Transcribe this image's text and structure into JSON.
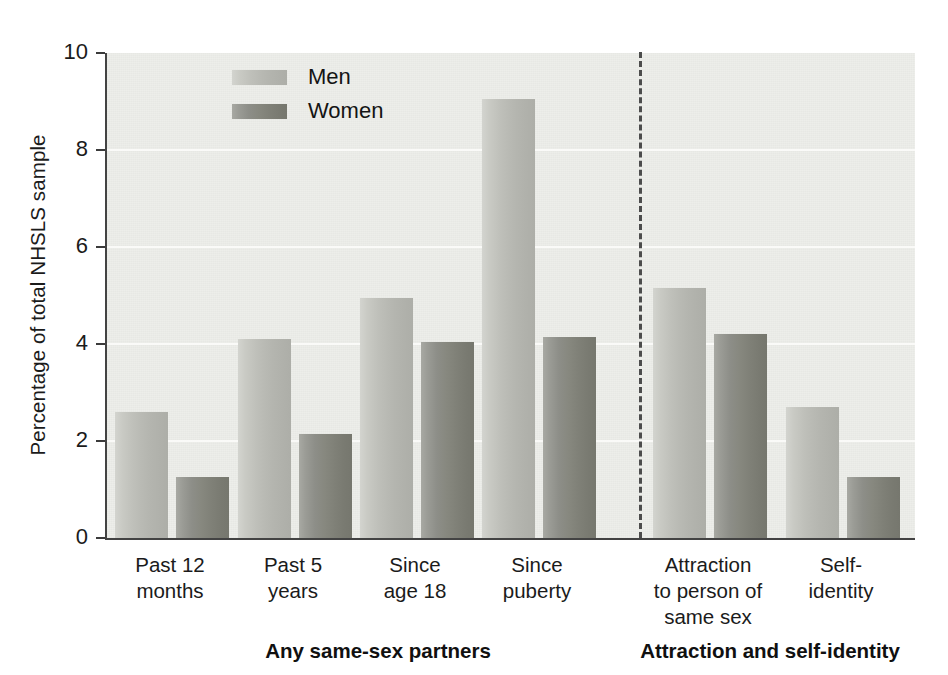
{
  "chart_data": {
    "type": "bar",
    "title": "",
    "xlabel": "",
    "ylabel": "Percentage of total NHSLS sample",
    "ylim": [
      0,
      10
    ],
    "yticks": [
      0,
      2,
      4,
      6,
      8,
      10
    ],
    "ytick_labels": [
      "0",
      "2",
      "4",
      "6",
      "8",
      "10"
    ],
    "grid": "horizontal",
    "legend_position": "upper-center-left",
    "categories": [
      "Past 12\nmonths",
      "Past 5\nyears",
      "Since\nage 18",
      "Since\npuberty",
      "Attraction\nto person of\nsame sex",
      "Self-\nidentity"
    ],
    "series": [
      {
        "name": "Men",
        "values": [
          2.6,
          4.1,
          4.95,
          9.05,
          5.15,
          2.7
        ]
      },
      {
        "name": "Women",
        "values": [
          1.25,
          2.15,
          4.05,
          4.15,
          4.2,
          1.25
        ]
      }
    ],
    "group_titles": [
      "Any same-sex partners",
      "Attraction and self-identity"
    ],
    "annotations": [
      "dashed vertical divider between 'Since puberty' and 'Attraction to person of same sex'"
    ]
  },
  "axis": {
    "y_title": "Percentage of total NHSLS sample",
    "ticks": [
      {
        "label": "10",
        "value": 10
      },
      {
        "label": "8",
        "value": 8
      },
      {
        "label": "6",
        "value": 6
      },
      {
        "label": "4",
        "value": 4
      },
      {
        "label": "2",
        "value": 2
      },
      {
        "label": "0",
        "value": 0
      }
    ]
  },
  "legend": {
    "items": [
      {
        "label": "Men",
        "color": "#bfc0ba"
      },
      {
        "label": "Women",
        "color": "#8b8c85"
      }
    ]
  },
  "categories": [
    {
      "line1": "Past 12",
      "line2": "months",
      "line3": ""
    },
    {
      "line1": "Past 5",
      "line2": "years",
      "line3": ""
    },
    {
      "line1": "Since",
      "line2": "age 18",
      "line3": ""
    },
    {
      "line1": "Since",
      "line2": "puberty",
      "line3": ""
    },
    {
      "line1": "Attraction",
      "line2": "to person of",
      "line3": "same sex"
    },
    {
      "line1": "Self-",
      "line2": "identity",
      "line3": ""
    }
  ],
  "groups": [
    {
      "title": "Any same-sex partners"
    },
    {
      "title": "Attraction and self-identity"
    }
  ],
  "colors": {
    "plot_background": "#edeeea",
    "axis": "#434343",
    "gridline": "#fafaf8",
    "men_bar": "#bfc0ba",
    "women_bar": "#8b8c85",
    "divider": "#4c4c4c",
    "text": "#1b1b1b"
  }
}
